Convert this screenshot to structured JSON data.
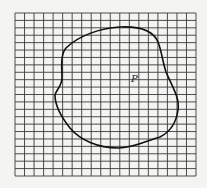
{
  "figure": {
    "grid": {
      "columns": 19,
      "rows": 22,
      "line_color": "#3a3a3a",
      "background": "#f4f4f2"
    },
    "region": {
      "label": "P",
      "stroke_color": "#111111"
    }
  }
}
